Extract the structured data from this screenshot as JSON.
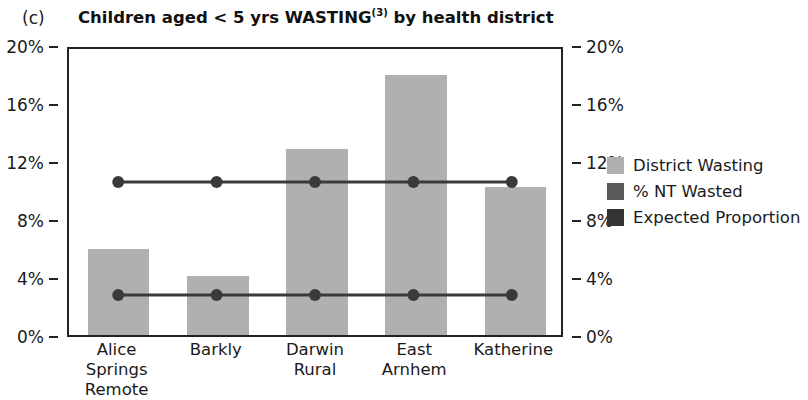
{
  "panel": {
    "letter": "(c)"
  },
  "title": {
    "main_before": "Children aged < 5 yrs WASTING",
    "superscript": "(3)",
    "main_after": " by health district"
  },
  "axes": {
    "left_ticks": [
      "0%",
      "4%",
      "8%",
      "12%",
      "16%",
      "20%"
    ],
    "right_ticks": [
      "0%",
      "4%",
      "8%",
      "12%",
      "16%",
      "20%"
    ]
  },
  "legend": {
    "items": [
      {
        "label": "District Wasting",
        "color": "#b0b0b0"
      },
      {
        "label": "% NT Wasted",
        "color": "#595959"
      },
      {
        "label": "Expected Proportion",
        "color": "#333333"
      }
    ]
  },
  "chart_data": {
    "type": "bar",
    "title": "Children aged < 5 yrs WASTING(3) by health district",
    "xlabel": "",
    "ylabel": "",
    "ylim": [
      0,
      20
    ],
    "ytick_values": [
      0,
      4,
      8,
      12,
      16,
      20
    ],
    "ytick_labels": [
      "0%",
      "4%",
      "8%",
      "12%",
      "16%",
      "20%"
    ],
    "grid": false,
    "legend_position": "right",
    "categories": [
      "Alice Springs Remote",
      "Barkly",
      "Darwin Rural",
      "East Arnhem",
      "Katherine"
    ],
    "category_lines": [
      [
        "Alice Springs",
        "Remote"
      ],
      [
        "Barkly",
        ""
      ],
      [
        "Darwin",
        "Rural"
      ],
      [
        "East",
        "Arnhem"
      ],
      [
        "Katherine",
        ""
      ]
    ],
    "series": [
      {
        "name": "District Wasting",
        "type": "bar",
        "color": "#b0b0b0",
        "values": [
          5.9,
          4.1,
          12.8,
          17.9,
          10.2
        ]
      },
      {
        "name": "% NT Wasted",
        "type": "line",
        "color": "#3a3a3a",
        "values": [
          10.7,
          10.7,
          10.7,
          10.7,
          10.7
        ]
      },
      {
        "name": "Expected Proportion",
        "type": "line",
        "color": "#3a3a3a",
        "values": [
          2.8,
          2.8,
          2.8,
          2.8,
          2.8
        ]
      }
    ]
  }
}
